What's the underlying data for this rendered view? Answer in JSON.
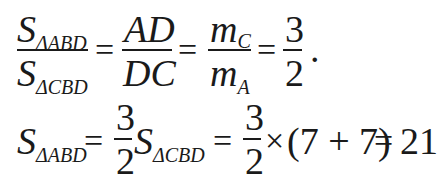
{
  "equation_line_1": {
    "frac1": {
      "num_main": "S",
      "num_sub": "ΔABD",
      "den_main": "S",
      "den_sub": "ΔCBD"
    },
    "eq1": "=",
    "frac2": {
      "num": "AD",
      "den": "DC"
    },
    "eq2": "=",
    "frac3": {
      "num_main": "m",
      "num_sub": "C",
      "den_main": "m",
      "den_sub": "A"
    },
    "eq3": "=",
    "frac4": {
      "num": "3",
      "den": "2"
    },
    "period": "."
  },
  "equation_line_2": {
    "lhs_main": "S",
    "lhs_sub": "ΔABD",
    "eq1": "=",
    "frac1": {
      "num": "3",
      "den": "2"
    },
    "mid_main": "S",
    "mid_sub": "ΔCBD",
    "eq2": "=",
    "frac2": {
      "num": "3",
      "den": "2"
    },
    "times": "×",
    "paren_expr": "(7 + 7)",
    "eq3": "=",
    "result": "21"
  }
}
